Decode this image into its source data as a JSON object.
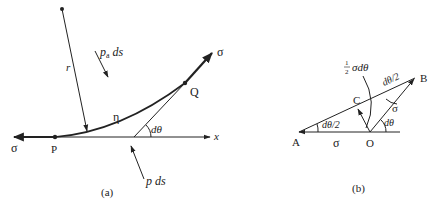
{
  "figure_a": {
    "caption": "(a)",
    "labels": {
      "radius": "r",
      "pa": "p",
      "pa_sub": "a",
      "pa_ds": " ds",
      "p_ds": "p ds",
      "sigma_left": "σ",
      "sigma_right": "σ",
      "point_p": "P",
      "point_q": "Q",
      "eta": "η",
      "dtheta": "dθ",
      "x_axis": "x"
    }
  },
  "figure_b": {
    "caption": "(b)",
    "labels": {
      "point_a": "A",
      "point_b": "B",
      "point_c": "C",
      "point_o": "O",
      "sigma_base": "σ",
      "sigma_ob": "σ",
      "half": "1",
      "half_den": "2",
      "half_sigma_dtheta": "σdθ",
      "dtheta_half_left": "dθ/2",
      "dtheta_half_top": "dθ/2",
      "dtheta": "dθ"
    }
  },
  "colors": {
    "ink": "#222222",
    "background": "#ffffff"
  }
}
